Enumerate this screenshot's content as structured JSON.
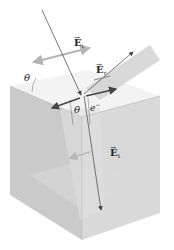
{
  "diagram": {
    "title": "",
    "labels": {
      "incident_field": {
        "symbol": "E",
        "subscript": "i",
        "arrow": "→"
      },
      "reflected_field": {
        "symbol": "E",
        "subscript": "r",
        "arrow": "→"
      },
      "transmitted_field": {
        "symbol": "E",
        "subscript": "t",
        "arrow": "→"
      },
      "angle_outer": "θ",
      "angle_inner": "θ",
      "electron": "e",
      "electron_charge": "−"
    },
    "colors": {
      "box_top": "#f2f2f2",
      "box_front": "#c8c8c8",
      "box_side": "#d6d6d6",
      "ray": "#555555",
      "field_arrow": "#b0b0b0",
      "surface_arrow": "#444444",
      "reflected_plane": "#cfcfcf"
    }
  }
}
